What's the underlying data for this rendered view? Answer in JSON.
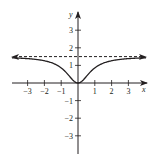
{
  "chart_data": {
    "type": "line",
    "title": "",
    "xlabel": "x",
    "ylabel": "y",
    "xlim": [
      -3.6,
      3.9
    ],
    "ylim": [
      -4.0,
      4.0
    ],
    "grid": false,
    "legend": null,
    "x_ticks": [
      -3,
      -2,
      -1,
      1,
      2,
      3
    ],
    "x_tick_labels": [
      "−3",
      "−2",
      "−1",
      "1",
      "2",
      "3"
    ],
    "y_ticks": [
      -3,
      -2,
      -1,
      1,
      2,
      3
    ],
    "y_tick_labels": [
      "−3",
      "−2",
      "−1",
      "1",
      "2",
      "3"
    ],
    "series": [
      {
        "name": "f(x)",
        "style": "solid",
        "description": "even function with minimum 0 at x=0, increasing toward horizontal asymptote y=1.5 at both ends (arrows)",
        "x": [
          -4,
          -3.5,
          -3,
          -2.5,
          -2,
          -1.5,
          -1,
          -0.75,
          -0.5,
          -0.25,
          0,
          0.25,
          0.5,
          0.75,
          1,
          1.5,
          2,
          2.5,
          3,
          3.5,
          4
        ],
        "y": [
          1.43,
          1.41,
          1.38,
          1.34,
          1.26,
          1.12,
          0.86,
          0.64,
          0.37,
          0.11,
          0,
          0.11,
          0.37,
          0.64,
          0.86,
          1.12,
          1.26,
          1.34,
          1.38,
          1.41,
          1.43
        ]
      },
      {
        "name": "asymptote y = 1.5",
        "style": "dashed",
        "x": [
          -4,
          4
        ],
        "y": [
          1.5,
          1.5
        ]
      }
    ],
    "annotations": []
  },
  "axes": {
    "x_label": "x",
    "y_label": "y"
  }
}
